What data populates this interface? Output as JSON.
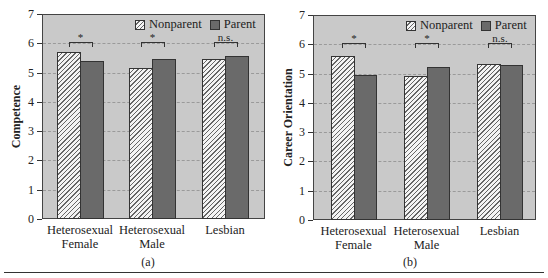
{
  "chart_data": [
    {
      "type": "bar",
      "panel_label": "(a)",
      "title": "",
      "xlabel": "",
      "ylabel": "Competence",
      "ylim": [
        0,
        7
      ],
      "yticks": [
        0,
        1,
        2,
        3,
        4,
        5,
        6,
        7
      ],
      "grid": true,
      "legend_position": "top-right",
      "categories": [
        "Heterosexual Female",
        "Heterosexual Male",
        "Lesbian"
      ],
      "category_lines": [
        [
          "Heterosexual",
          "Female"
        ],
        [
          "Heterosexual",
          "Male"
        ],
        [
          "Lesbian"
        ]
      ],
      "series": [
        {
          "name": "Nonparent",
          "values": [
            5.71,
            5.16,
            5.48
          ]
        },
        {
          "name": "Parent",
          "values": [
            5.4,
            5.45,
            5.56
          ]
        }
      ],
      "annotations": [
        "*",
        "*",
        "n.s."
      ]
    },
    {
      "type": "bar",
      "panel_label": "(b)",
      "title": "",
      "xlabel": "",
      "ylabel": "Career Orientation",
      "ylim": [
        0,
        7
      ],
      "yticks": [
        0,
        1,
        2,
        3,
        4,
        5,
        6,
        7
      ],
      "grid": true,
      "legend_position": "top-right",
      "categories": [
        "Heterosexual Female",
        "Heterosexual Male",
        "Lesbian"
      ],
      "category_lines": [
        [
          "Heterosexual",
          "Female"
        ],
        [
          "Heterosexual",
          "Male"
        ],
        [
          "Lesbian"
        ]
      ],
      "series": [
        {
          "name": "Nonparent",
          "values": [
            5.6,
            4.91,
            5.32
          ]
        },
        {
          "name": "Parent",
          "values": [
            4.95,
            5.21,
            5.29
          ]
        }
      ],
      "annotations": [
        "*",
        "*",
        "n.s."
      ]
    }
  ],
  "legend": {
    "nonparent": "Nonparent",
    "parent": "Parent"
  },
  "colors": {
    "plot_bg": "#c9c9c9",
    "parent_bar": "#6a6a6a",
    "nonparent_bar": "#f4f4f4",
    "axis": "#444444"
  }
}
